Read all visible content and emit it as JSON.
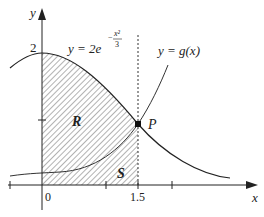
{
  "diagram": {
    "axes": {
      "x_label": "x",
      "y_label": "y"
    },
    "tick_labels": {
      "origin": "0",
      "x_tick": "1.5",
      "y_tick": "2"
    },
    "curves": {
      "f": {
        "label_prefix": "y = 2e",
        "exponent_num": "x²",
        "exponent_den": "3",
        "exponent_sign": "−"
      },
      "g": {
        "label": "y = g(x)"
      }
    },
    "points": {
      "P": "P"
    },
    "regions": {
      "R": "R",
      "S": "S"
    },
    "colors": {
      "line": "#222222",
      "hatch": "#555555"
    }
  }
}
